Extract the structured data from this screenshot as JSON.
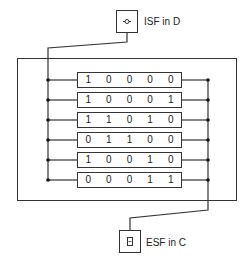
{
  "diagram": {
    "source_node": {
      "label": "ISF in D",
      "icon": "connector-circle-icon"
    },
    "target_node": {
      "label": "ESF in C",
      "icon": "memory-chip-icon"
    },
    "rows": [
      {
        "bits": [
          "1",
          "0",
          "0",
          "0",
          "0"
        ]
      },
      {
        "bits": [
          "1",
          "0",
          "0",
          "0",
          "1"
        ]
      },
      {
        "bits": [
          "1",
          "1",
          "0",
          "1",
          "0"
        ]
      },
      {
        "bits": [
          "0",
          "1",
          "1",
          "0",
          "0"
        ]
      },
      {
        "bits": [
          "1",
          "0",
          "0",
          "1",
          "0"
        ]
      },
      {
        "bits": [
          "0",
          "0",
          "0",
          "1",
          "1"
        ]
      }
    ],
    "colors": {
      "line": "#333333",
      "background": "#ffffff",
      "text": "#222222"
    }
  }
}
